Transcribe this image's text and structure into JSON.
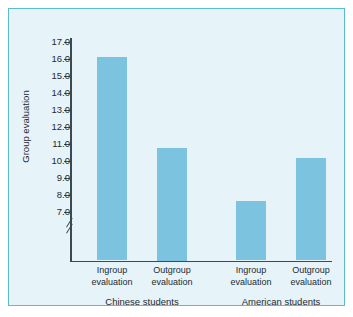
{
  "chart_data": {
    "type": "bar",
    "title": "",
    "xlabel": "",
    "ylabel": "Group evaluation",
    "ylim": [
      6.2,
      17.4
    ],
    "axis_break": true,
    "axis_break_note": "y-axis broken below 7.0",
    "grid": false,
    "legend": null,
    "ytick_labels": [
      "17.0",
      "16.0",
      "15.0",
      "14.0",
      "13.0",
      "12.0",
      "11.0",
      "10.0",
      "9.0",
      "8.0",
      "7.0"
    ],
    "ytick_values": [
      17.0,
      16.0,
      15.0,
      14.0,
      13.0,
      12.0,
      11.0,
      10.0,
      9.0,
      8.0,
      7.0
    ],
    "categories": [
      "Ingroup evaluation",
      "Outgroup evaluation",
      "Ingroup evaluation",
      "Outgroup evaluation"
    ],
    "groups": [
      "Chinese students",
      "American students"
    ],
    "values": [
      16.1,
      10.75,
      7.65,
      10.2
    ],
    "bars": [
      {
        "label_line1": "Ingroup",
        "label_line2": "evaluation",
        "group": "Chinese students",
        "value": 16.1
      },
      {
        "label_line1": "Outgroup",
        "label_line2": "evaluation",
        "group": "Chinese students",
        "value": 10.75
      },
      {
        "label_line1": "Ingroup",
        "label_line2": "evaluation",
        "group": "American students",
        "value": 7.65
      },
      {
        "label_line1": "Outgroup",
        "label_line2": "evaluation",
        "group": "American students",
        "value": 10.2
      }
    ],
    "colors": {
      "bar": "#7cc3e0",
      "panel_background": "#e6f3f8",
      "panel_border": "#5bbcd0",
      "axis": "#3a4a52",
      "text": "#1d2b33"
    }
  }
}
